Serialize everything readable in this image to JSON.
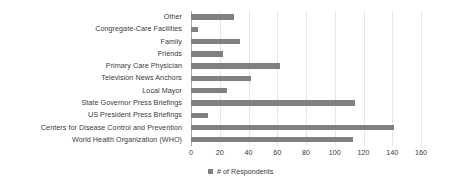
{
  "chart_data": {
    "type": "bar",
    "orientation": "horizontal",
    "title": "",
    "xlabel": "",
    "ylabel": "",
    "xlim": [
      0,
      160
    ],
    "xticks": [
      0,
      20,
      40,
      60,
      80,
      100,
      120,
      140,
      160
    ],
    "grid": true,
    "legend_position": "bottom",
    "series_name": "# of Respondents",
    "bar_color": "#808080",
    "gridline_color": "#e6e6e6",
    "axis_color": "#a8a8a8",
    "text_color": "#3b3b3b",
    "categories": [
      "Other",
      "Congregate-Care Facilities",
      "Family",
      "Friends",
      "Primary Care Physician",
      "Television News Anchors",
      "Local Mayor",
      "State Governor Press Briefings",
      "US President Press Briefings",
      "Centers for Disease Control and Prevention",
      "World Health Organization (WHO)"
    ],
    "values": [
      30,
      5,
      34,
      22,
      62,
      42,
      25,
      114,
      12,
      141,
      113
    ],
    "legend": [
      "# of Respondents"
    ]
  }
}
